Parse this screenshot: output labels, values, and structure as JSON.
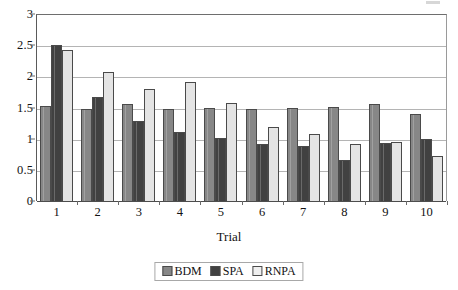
{
  "chart_data": {
    "type": "bar",
    "title": "",
    "xlabel": "Trial",
    "ylabel": "",
    "categories": [
      "1",
      "2",
      "3",
      "4",
      "5",
      "6",
      "7",
      "8",
      "9",
      "10"
    ],
    "series": [
      {
        "name": "BDM",
        "color": "#878787",
        "values": [
          1.53,
          1.47,
          1.55,
          1.48,
          1.49,
          1.47,
          1.49,
          1.51,
          1.56,
          1.4
        ]
      },
      {
        "name": "SPA",
        "color": "#414141",
        "values": [
          2.5,
          1.67,
          1.29,
          1.1,
          1.01,
          0.92,
          0.89,
          0.65,
          0.93,
          1.0
        ]
      },
      {
        "name": "RNPA",
        "color": "#e4e4e4",
        "values": [
          2.43,
          2.07,
          1.8,
          1.91,
          1.58,
          1.18,
          1.08,
          0.91,
          0.95,
          0.73
        ]
      }
    ],
    "ylim": [
      0,
      3
    ],
    "yticks": [
      "0",
      "0.5",
      "1",
      "1.5",
      "2",
      "2.5",
      "3"
    ],
    "ytick_values": [
      0,
      0.5,
      1,
      1.5,
      2,
      2.5,
      3
    ],
    "grid": true,
    "legend_position": "bottom"
  },
  "axes": {
    "x_title": "Trial"
  },
  "legend": {
    "entries": [
      {
        "label": "BDM"
      },
      {
        "label": "SPA"
      },
      {
        "label": "RNPA"
      }
    ]
  }
}
